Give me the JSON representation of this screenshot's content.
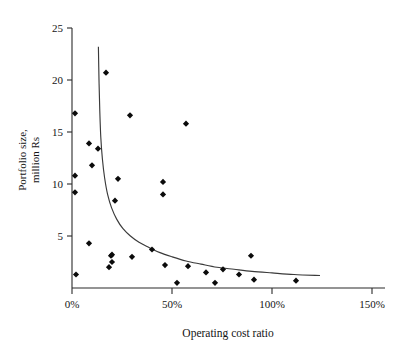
{
  "chart_data": {
    "type": "scatter",
    "title": "",
    "xlabel": "Operating cost ratio",
    "ylabel": "Portfolio size, million Rs",
    "ylabel_line1": "Portfolio size,",
    "ylabel_line2": "million Rs",
    "xlim": [
      0,
      150
    ],
    "ylim": [
      0,
      25
    ],
    "xtick_values": [
      0,
      50,
      100,
      150
    ],
    "xtick_labels": [
      "0%",
      "50%",
      "100%",
      "150%"
    ],
    "ytick_values": [
      5,
      10,
      15,
      20,
      25
    ],
    "ytick_labels": [
      "5",
      "10",
      "15",
      "20",
      "25"
    ],
    "grid": false,
    "legend": null,
    "marker_style": "filled-diamond",
    "marker_color": "#0b0b0b",
    "curve_color": "#3a3a3a",
    "points": [
      {
        "x": 1.5,
        "y": 16.8
      },
      {
        "x": 1.5,
        "y": 10.8
      },
      {
        "x": 1.5,
        "y": 9.2
      },
      {
        "x": 2.0,
        "y": 1.3
      },
      {
        "x": 8.5,
        "y": 13.9
      },
      {
        "x": 8.5,
        "y": 4.3
      },
      {
        "x": 10.0,
        "y": 11.8
      },
      {
        "x": 13.0,
        "y": 13.4
      },
      {
        "x": 17.0,
        "y": 20.7
      },
      {
        "x": 18.5,
        "y": 2.0
      },
      {
        "x": 19.5,
        "y": 3.1
      },
      {
        "x": 20.0,
        "y": 3.2
      },
      {
        "x": 20.0,
        "y": 2.5
      },
      {
        "x": 21.5,
        "y": 8.4
      },
      {
        "x": 23.0,
        "y": 10.5
      },
      {
        "x": 29.0,
        "y": 16.6
      },
      {
        "x": 30.0,
        "y": 3.0
      },
      {
        "x": 40.0,
        "y": 3.7
      },
      {
        "x": 45.5,
        "y": 10.2
      },
      {
        "x": 45.5,
        "y": 9.0
      },
      {
        "x": 46.5,
        "y": 2.2
      },
      {
        "x": 52.5,
        "y": 0.5
      },
      {
        "x": 57.0,
        "y": 15.8
      },
      {
        "x": 58.0,
        "y": 2.1
      },
      {
        "x": 67.0,
        "y": 1.5
      },
      {
        "x": 71.5,
        "y": 0.5
      },
      {
        "x": 75.5,
        "y": 1.8
      },
      {
        "x": 83.5,
        "y": 1.3
      },
      {
        "x": 89.5,
        "y": 3.1
      },
      {
        "x": 91.0,
        "y": 0.8
      },
      {
        "x": 112.0,
        "y": 0.7
      }
    ],
    "fit_curve": {
      "description": "hyperbolic decay fit",
      "points": [
        {
          "x": 13.2,
          "y": 23.2
        },
        {
          "x": 13.5,
          "y": 20.0
        },
        {
          "x": 13.9,
          "y": 17.0
        },
        {
          "x": 14.4,
          "y": 14.5
        },
        {
          "x": 15.2,
          "y": 12.4
        },
        {
          "x": 16.3,
          "y": 10.6
        },
        {
          "x": 17.8,
          "y": 9.0
        },
        {
          "x": 19.8,
          "y": 7.7
        },
        {
          "x": 22.4,
          "y": 6.6
        },
        {
          "x": 25.5,
          "y": 5.7
        },
        {
          "x": 29.2,
          "y": 5.0
        },
        {
          "x": 33.5,
          "y": 4.4
        },
        {
          "x": 38.5,
          "y": 3.9
        },
        {
          "x": 44.0,
          "y": 3.4
        },
        {
          "x": 50.0,
          "y": 3.0
        },
        {
          "x": 57.0,
          "y": 2.6
        },
        {
          "x": 64.5,
          "y": 2.3
        },
        {
          "x": 72.5,
          "y": 2.0
        },
        {
          "x": 81.0,
          "y": 1.8
        },
        {
          "x": 90.0,
          "y": 1.6
        },
        {
          "x": 100.0,
          "y": 1.45
        },
        {
          "x": 111.0,
          "y": 1.3
        },
        {
          "x": 124.0,
          "y": 1.2
        }
      ]
    }
  }
}
